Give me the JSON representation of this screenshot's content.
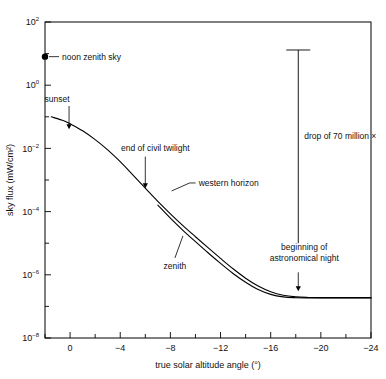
{
  "chart_data": {
    "type": "line",
    "title": "",
    "xlabel": "true solar altitude angle (°)",
    "ylabel": "sky flux (mW/cm²)",
    "yscale": "log",
    "xlim": [
      2,
      -24
    ],
    "ylim": [
      1e-08,
      100
    ],
    "grid": false,
    "legend": "inline-labels",
    "x_ticks_major": [
      0,
      -4,
      -8,
      -12,
      -16,
      -20,
      -24
    ],
    "x_tick_labels": [
      "0",
      "−4",
      "−8",
      "−12",
      "−16",
      "−20",
      "−24"
    ],
    "x_ticks_minor": [
      2,
      -2,
      -6,
      -10,
      -14,
      -18,
      -22
    ],
    "y_ticks_major": [
      100,
      1,
      0.01,
      0.0001,
      1e-06,
      1e-08
    ],
    "y_tick_mantissa": [
      "10",
      "10",
      "10",
      "10",
      "10",
      "10"
    ],
    "y_tick_exponents": [
      "2",
      "0",
      "−2",
      "−4",
      "−6",
      "−8"
    ],
    "y_ticks_minor": [
      10,
      0.1,
      0.001,
      1e-05,
      1e-07
    ],
    "series": [
      {
        "name": "western horizon",
        "points": [
          [
            1.5,
            0.1
          ],
          [
            0.5,
            0.075
          ],
          [
            0.0,
            0.06
          ],
          [
            -1.0,
            0.036
          ],
          [
            -2.0,
            0.019
          ],
          [
            -3.0,
            0.009
          ],
          [
            -4.0,
            0.0038
          ],
          [
            -5.0,
            0.00145
          ],
          [
            -6.0,
            0.00055
          ],
          [
            -7.0,
            0.00021
          ],
          [
            -8.0,
            8.5e-05
          ],
          [
            -9.0,
            3.6e-05
          ],
          [
            -10.0,
            1.6e-05
          ],
          [
            -11.0,
            7.2e-06
          ],
          [
            -12.0,
            3.3e-06
          ],
          [
            -13.0,
            1.55e-06
          ],
          [
            -14.0,
            7.8e-07
          ],
          [
            -15.0,
            4.4e-07
          ],
          [
            -16.0,
            2.9e-07
          ],
          [
            -17.0,
            2.25e-07
          ],
          [
            -18.0,
            2e-07
          ],
          [
            -19.0,
            1.92e-07
          ],
          [
            -20.0,
            1.9e-07
          ],
          [
            -22.0,
            1.9e-07
          ],
          [
            -24.0,
            1.9e-07
          ]
        ]
      },
      {
        "name": "zenith",
        "points": [
          [
            -7.0,
            0.00016
          ],
          [
            -8.0,
            6.2e-05
          ],
          [
            -9.0,
            2.55e-05
          ],
          [
            -10.0,
            1.12e-05
          ],
          [
            -11.0,
            5e-06
          ],
          [
            -12.0,
            2.3e-06
          ],
          [
            -13.0,
            1.1e-06
          ],
          [
            -14.0,
            5.8e-07
          ],
          [
            -15.0,
            3.4e-07
          ],
          [
            -16.0,
            2.4e-07
          ],
          [
            -17.0,
            2e-07
          ],
          [
            -18.0,
            1.88e-07
          ],
          [
            -19.0,
            1.85e-07
          ],
          [
            -20.0,
            1.85e-07
          ],
          [
            -22.0,
            1.85e-07
          ],
          [
            -24.0,
            1.85e-07
          ]
        ]
      }
    ],
    "markers": [
      {
        "name": "noon-zenith-sky",
        "x": 2,
        "y": 8.0,
        "label": "noon zenith sky",
        "shape": "filled-circle"
      }
    ],
    "annotations": [
      {
        "name": "sunset",
        "label": "sunset",
        "x": 0.4,
        "y": 0.04,
        "arrow": "down"
      },
      {
        "name": "end-of-civil-twilight",
        "label": "end of civil twilight",
        "x": -6.0,
        "y": 0.00055,
        "arrow": "down"
      },
      {
        "name": "western-horizon",
        "label": "western horizon",
        "x": -8.1,
        "y": 0.00045,
        "arrow": "leader"
      },
      {
        "name": "zenith",
        "label": "zenith",
        "x": -9.0,
        "y": 1.7e-05,
        "arrow": "leader"
      },
      {
        "name": "drop-of-70-million",
        "label": "drop of 70 million ×",
        "x": -18.2,
        "y": 0.02
      },
      {
        "name": "beginning-of-astronomical-night",
        "label_line1": "beginning of",
        "label_line2": "astronomical night",
        "x": -18.2,
        "y": 1.2e-06,
        "arrow": "down"
      }
    ],
    "drop_bar": {
      "name": "drop-bar",
      "x": -18.2,
      "y_top": 13.0,
      "y_bottom": 1.9e-07
    }
  },
  "colors": {
    "ink": "#000000",
    "background": "#ffffff"
  }
}
